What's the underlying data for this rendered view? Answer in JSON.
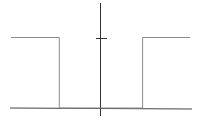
{
  "chart_data": {
    "type": "line",
    "title": "",
    "xlabel": "",
    "ylabel": "",
    "grid": false,
    "legend": null,
    "x": [
      -1.0,
      -0.46,
      -0.46,
      0.47,
      0.47,
      1.0
    ],
    "series": [
      {
        "name": "f(x)",
        "values": [
          1,
          1,
          0,
          0,
          1,
          1
        ]
      }
    ],
    "xlim": [
      -1.0,
      1.0
    ],
    "ylim": [
      -0.1,
      1.5
    ],
    "yticks": [
      1
    ],
    "colors": {
      "axes": "#333333",
      "curve": "#8a8a8a"
    }
  }
}
